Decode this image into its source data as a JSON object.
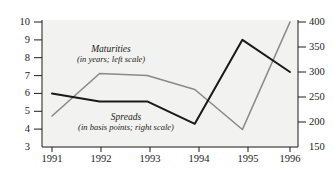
{
  "chart_data": {
    "type": "line",
    "title": "",
    "xlabel": "",
    "ylabel": "",
    "grid": false,
    "legend_position": "inline-annotations",
    "categories": [
      "1991",
      "1992",
      "1993",
      "1994",
      "1995",
      "1996"
    ],
    "x": [
      1991,
      1992,
      1993,
      1994,
      1995,
      1996
    ],
    "axes": {
      "left": {
        "label": "Maturities (in years)",
        "ticks": [
          3,
          4,
          5,
          6,
          7,
          8,
          9,
          10
        ],
        "ylim": [
          3,
          10
        ]
      },
      "right": {
        "label": "Spreads (in basis points)",
        "ticks": [
          150,
          200,
          250,
          300,
          350,
          400
        ],
        "ylim": [
          150,
          400
        ]
      }
    },
    "series": [
      {
        "name": "Maturities",
        "axis": "left",
        "unit": "years",
        "color": "#1a1a1a",
        "values": [
          6.0,
          5.55,
          5.55,
          4.3,
          9.0,
          7.2
        ]
      },
      {
        "name": "Spreads",
        "axis": "right",
        "unit": "basis points",
        "color": "#8a8a8a",
        "values": [
          212,
          297,
          293,
          265,
          185,
          400
        ]
      }
    ],
    "annotations": [
      {
        "id": "maturities-annotation",
        "title": "Maturities",
        "subtitle": "(in years; left scale)"
      },
      {
        "id": "spreads-annotation",
        "title": "Spreads",
        "subtitle": "(in basis points; right scale)"
      }
    ]
  },
  "axis_left_labels": [
    "10",
    "9",
    "8",
    "7",
    "6",
    "5",
    "4",
    "3"
  ],
  "axis_right_labels": [
    "400",
    "350",
    "300",
    "250",
    "200",
    "150"
  ],
  "axis_x_labels": [
    "1991",
    "1992",
    "1993",
    "1994",
    "1995",
    "1996"
  ],
  "annotations": {
    "maturities": {
      "title": "Maturities",
      "subtitle": "(in years; left scale)"
    },
    "spreads": {
      "title": "Spreads",
      "subtitle": "(in basis points; right scale)"
    }
  },
  "colors": {
    "maturities_line": "#1a1a1a",
    "spreads_line": "#8a8a8a",
    "axis": "#1c1c1c",
    "plot_background": "#f2f2f0"
  }
}
